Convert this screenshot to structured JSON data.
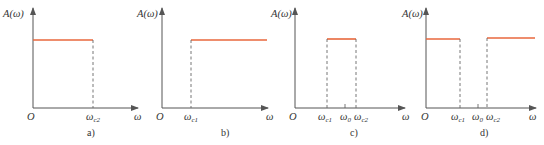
{
  "figure": {
    "colors": {
      "response": "#e8673c",
      "axis": "#555555"
    },
    "y_axis_label": "A(ω)",
    "x_axis_label": "ω",
    "origin_label": "O",
    "panels": [
      {
        "id": "a",
        "caption": "a)",
        "type": "low-pass",
        "cutoffs": [
          "ωc2"
        ]
      },
      {
        "id": "b",
        "caption": "b)",
        "type": "high-pass",
        "cutoffs": [
          "ωc1"
        ]
      },
      {
        "id": "c",
        "caption": "c)",
        "type": "band-pass",
        "cutoffs": [
          "ωc1",
          "ω0",
          "ωc2"
        ]
      },
      {
        "id": "d",
        "caption": "d)",
        "type": "band-stop",
        "cutoffs": [
          "ωc1",
          "ω0",
          "ωc2"
        ]
      }
    ],
    "labels": {
      "omega": "ω",
      "c1": "c1",
      "c2": "c2",
      "zero": "0"
    }
  }
}
